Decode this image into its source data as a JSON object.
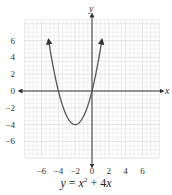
{
  "chart_data": {
    "type": "line",
    "title": "",
    "equation": "y = x² + 4x",
    "caption": {
      "prefix": "y",
      "eq": " = ",
      "x": "x",
      "sup": "2",
      "rest": " + 4",
      "x2": "x"
    },
    "xlabel": "x",
    "ylabel": "y",
    "xlim": [
      -8,
      8
    ],
    "ylim": [
      -8,
      8.5
    ],
    "grid": true,
    "x_ticks": [
      -6,
      -4,
      -2,
      0,
      2,
      4,
      6
    ],
    "y_ticks": [
      6,
      4,
      2,
      0,
      -2,
      -4,
      -6
    ],
    "x_tick_labels": [
      "−6",
      "−4",
      "−2",
      "0",
      "2",
      "4",
      "6"
    ],
    "y_tick_labels": [
      "6",
      "4",
      "2",
      "0",
      "−2",
      "−4",
      "−6"
    ],
    "series": [
      {
        "name": "y = x^2 + 4x",
        "function": "x^2 + 4x",
        "x_range": [
          -5.15,
          1.15
        ],
        "vertex": [
          -2,
          -4
        ],
        "x_intercepts": [
          -4,
          0
        ],
        "points": [
          [
            -5.15,
            6
          ],
          [
            -5,
            5
          ],
          [
            -4,
            0
          ],
          [
            -3,
            -3
          ],
          [
            -2,
            -4
          ],
          [
            -1,
            -3
          ],
          [
            0,
            0
          ],
          [
            1,
            5
          ],
          [
            1.15,
            6
          ]
        ],
        "arrows": "both-ends"
      }
    ],
    "colors": {
      "grid": "#d9d9d9",
      "axis": "#333333",
      "curve": "#555555"
    }
  }
}
